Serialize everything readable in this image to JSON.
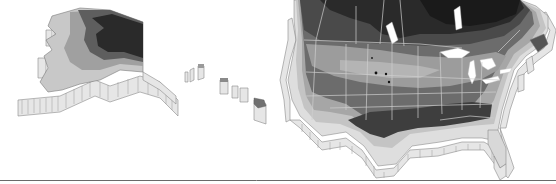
{
  "map": {
    "subject": "Plant hardiness zone map (3D extruded relief)",
    "regions": [
      {
        "id": "alaska",
        "label": ""
      },
      {
        "id": "hawaii",
        "label": ""
      },
      {
        "id": "contiguous-us-canada",
        "label": ""
      }
    ],
    "zone_shades": [
      "#1e1e1e",
      "#3a3a3a",
      "#555555",
      "#6e6e6e",
      "#8a8a8a",
      "#a8a8a8",
      "#c6c6c6",
      "#dedede"
    ],
    "baseline_color": "#6a6a6a",
    "background": "#ffffff"
  }
}
